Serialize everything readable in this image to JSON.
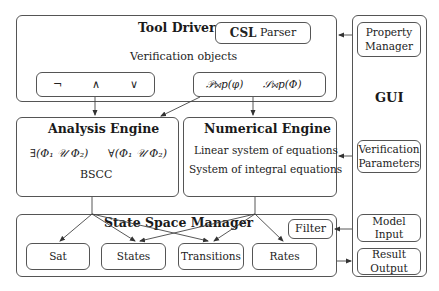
{
  "tool_driver": {
    "title": "Tool Driver",
    "csl_parser": {
      "bold": "CSL",
      "rest": " Parser"
    },
    "subtitle": "Verification objects",
    "operators": [
      "¬",
      "∧",
      "∨"
    ],
    "prob_ops": [
      "𝒫⋈p(φ)",
      "𝒮⋈p(Φ)"
    ]
  },
  "analysis_engine": {
    "title": "Analysis Engine",
    "exists_until": "∃(Φ₁ 𝒰 Φ₂)",
    "forall_until": "∀(Φ₁ 𝒰 Φ₂)",
    "bscc": "BSCC"
  },
  "numerical_engine": {
    "title": "Numerical Engine",
    "line1": "Linear system of equations",
    "line2": "System of integral equations"
  },
  "state_space_manager": {
    "title": "State Space Manager",
    "filter": "Filter",
    "items": [
      "Sat",
      "States",
      "Transitions",
      "Rates"
    ]
  },
  "gui": {
    "title": "GUI",
    "property_manager": "Property Manager",
    "verification_parameters": "Verification Parameters",
    "model_input": "Model Input",
    "result_output": "Result Output"
  },
  "colors": {
    "stroke": "#555555",
    "text": "#222222",
    "background": "#ffffff"
  }
}
